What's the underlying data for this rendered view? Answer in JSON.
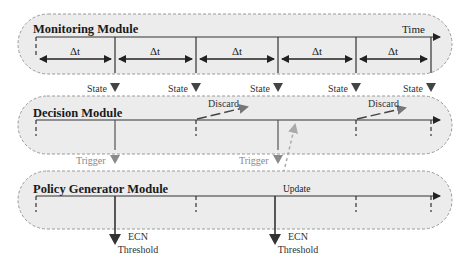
{
  "modules": {
    "monitoring": {
      "title": "Monitoring Module",
      "axis_label": "Time",
      "interval_label": "Δt",
      "interval_count": 5
    },
    "decision": {
      "title": "Decision Module"
    },
    "policy": {
      "title": "Policy Generator Module"
    }
  },
  "signals": {
    "state": "State",
    "discard": "Discard",
    "trigger": "Trigger",
    "update": "Update",
    "ecn_line1": "ECN",
    "ecn_line2": "Threshold"
  },
  "colors": {
    "panel_fill": "#ececec",
    "panel_border": "#9a9a9a",
    "axis": "#333333",
    "arrow_dark": "#444444",
    "arrow_gray": "#8a8a8a"
  }
}
